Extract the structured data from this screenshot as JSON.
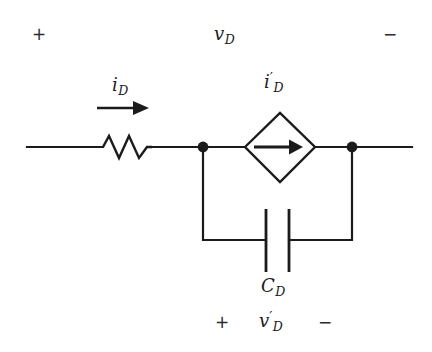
{
  "figure": {
    "kind": "circuit-schematic",
    "background_color": "#ffffff",
    "line_color": "#1b1b1b"
  },
  "labels": {
    "terminal_plus_top": "+",
    "terminal_minus_top": "−",
    "voltage_across": {
      "symbol": "v",
      "subscript": "D",
      "prime": ""
    },
    "branch_current": {
      "symbol": "i",
      "subscript": "D",
      "prime": ""
    },
    "source_current": {
      "symbol": "i",
      "subscript": "D",
      "prime": "′"
    },
    "capacitor": {
      "symbol": "C",
      "subscript": "D",
      "prime": ""
    },
    "cap_voltage": {
      "symbol": "v",
      "subscript": "D",
      "prime": "′"
    },
    "terminal_plus_bottom": "+",
    "terminal_minus_bottom": "−"
  },
  "components": {
    "resistor": {
      "name": "resistor",
      "orientation": "horizontal"
    },
    "dependent_source": {
      "name": "dependent-current-source",
      "shape": "diamond",
      "arrow_direction": "right"
    },
    "capacitor": {
      "name": "capacitor",
      "orientation": "vertical-plates"
    },
    "nodes": [
      {
        "name": "left-node",
        "x": 203,
        "y": 147
      },
      {
        "name": "right-node",
        "x": 352,
        "y": 147
      }
    ],
    "current_arrow": {
      "name": "current-direction-arrow",
      "direction": "right"
    }
  }
}
